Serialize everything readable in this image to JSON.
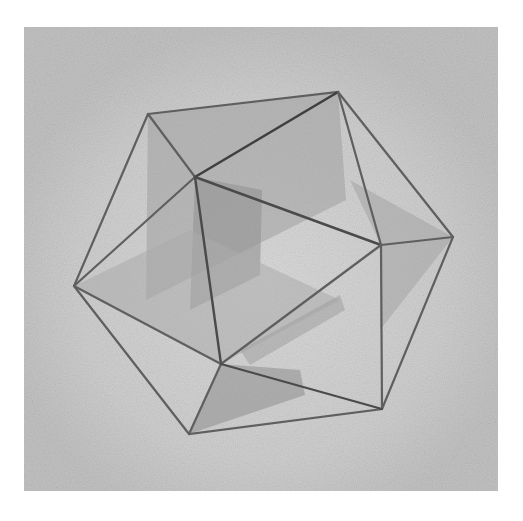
{
  "artwork": {
    "subject": "Icosahedron with three interlocking golden rectangles",
    "medium": "pencil drawing",
    "colors": {
      "page": "#ffffff",
      "paper": "#c9c9c9",
      "paper_light": "#d8d8d8",
      "edge": "#5f5f5f",
      "edge_dark": "#3f3f3f",
      "plane_dark": "#8a8a8a",
      "plane_mid": "#a3a3a3",
      "plane_light": "#b8b8b8"
    },
    "panel": {
      "x": 24,
      "y": 27,
      "width": 474,
      "height": 464
    },
    "vertices": {
      "top_left": [
        148,
        114
      ],
      "top_right": [
        338,
        92
      ],
      "right": [
        453,
        237
      ],
      "bottom_right": [
        382,
        409
      ],
      "bottom_left": [
        189,
        434
      ],
      "left": [
        74,
        286
      ],
      "inner_top": [
        195,
        177
      ],
      "inner_right": [
        381,
        245
      ],
      "inner_bottom": [
        221,
        364
      ],
      "back_upper_left": [
        146,
        133
      ],
      "back_right": [
        346,
        200
      ],
      "back_bottom": [
        186,
        380
      ]
    }
  }
}
